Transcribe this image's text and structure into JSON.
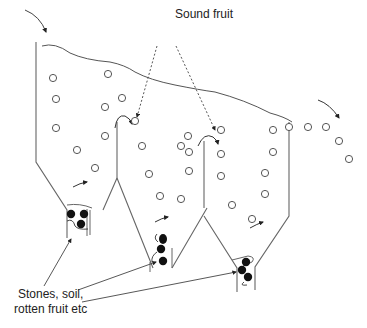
{
  "diagram": {
    "labels": {
      "sound_fruit": "Sound fruit",
      "debris_line1": "Stones, soil,",
      "debris_line2": "rotten fruit etc"
    },
    "colors": {
      "stroke": "#555555",
      "text": "#222222",
      "debris_fill": "#111111",
      "background": "#ffffff"
    },
    "components": {
      "tanks": [
        {
          "name": "tank-1",
          "role": "first washing tank"
        },
        {
          "name": "tank-2",
          "role": "second washing tank"
        },
        {
          "name": "tank-3",
          "role": "third washing tank"
        }
      ],
      "water_surface": "wavy line across tops of tanks",
      "inflow_arrow": "fruit entering at top-left",
      "outflow_arrow": "fruit leaving at right",
      "sound_fruit_symbol": "open circle",
      "debris_symbol": "filled circle"
    }
  }
}
